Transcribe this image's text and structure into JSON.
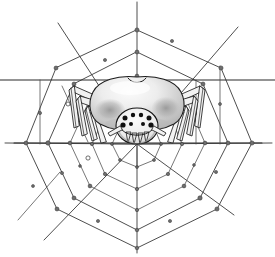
{
  "artwork": {
    "title": "Spider on Orb Web",
    "subject": "spider",
    "style": "black and white line drawing with gray shading",
    "background_color": "#ffffff",
    "ink_color": "#1c1c1c",
    "web_strand_color": "#3a3a3a",
    "node_color": "#6e6e6e",
    "abdomen_light": "#f4f4f4",
    "abdomen_mid": "#c9c9c9",
    "abdomen_shadow": "#8f8f8f",
    "leg_fill": "#f2f2f2",
    "canvas_width": 275,
    "canvas_height": 257
  },
  "spider": {
    "name": "spider-figure",
    "abdomen_label": "abdomen",
    "cephalothorax_label": "cephalothorax",
    "head_label": "head",
    "eye_count": 8,
    "leg_count": 8,
    "fang_label": "chelicerae",
    "center_x": 137,
    "center_y": 112
  },
  "web": {
    "name": "orb-web",
    "center_x": 137,
    "center_y": 144,
    "radial_count": 8,
    "ring_count": 5,
    "node_count": 44,
    "anchor_lines": [
      {
        "name": "upper-horizontal-anchor",
        "y": 80
      },
      {
        "name": "lower-horizontal-anchor",
        "y": 143
      }
    ],
    "radials": [
      {
        "name": "radial-up",
        "angle_deg": 270,
        "x2": 137,
        "y2": 2
      },
      {
        "name": "radial-upper-right",
        "angle_deg": 315,
        "x2": 238,
        "y2": 27
      },
      {
        "name": "radial-right",
        "angle_deg": 0,
        "x2": 272,
        "y2": 143
      },
      {
        "name": "radial-lower-right",
        "angle_deg": 45,
        "x2": 234,
        "y2": 215
      },
      {
        "name": "radial-down",
        "angle_deg": 90,
        "x2": 137,
        "y2": 253
      },
      {
        "name": "radial-lower-left",
        "angle_deg": 135,
        "x2": 44,
        "y2": 240
      },
      {
        "name": "radial-left",
        "angle_deg": 180,
        "x2": 5,
        "y2": 143
      },
      {
        "name": "radial-upper-left",
        "angle_deg": 225,
        "x2": 58,
        "y2": 23
      }
    ],
    "detached_strand": {
      "name": "broken-strand",
      "x1": 18,
      "y1": 220,
      "x2": 60,
      "y2": 172
    }
  },
  "web_rings": [
    {
      "name": "ring-1-innermost",
      "radius": 26
    },
    {
      "name": "ring-2",
      "radius": 48
    },
    {
      "name": "ring-3",
      "radius": 70
    },
    {
      "name": "ring-4",
      "radius": 92
    },
    {
      "name": "ring-5-outermost",
      "radius": 112
    }
  ]
}
